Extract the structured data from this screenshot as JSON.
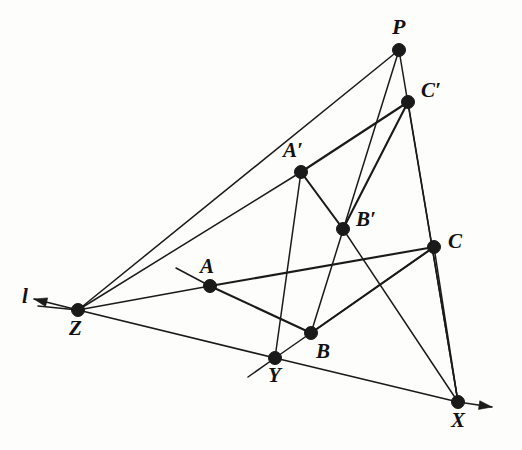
{
  "figure": {
    "background_color": "#fdfdfb",
    "stroke_color": "#1a1a1a",
    "label_color": "#111111",
    "width": 522,
    "height": 450,
    "point_radius": 6.5,
    "line_width": 2.1,
    "thin_line_width": 1.5
  },
  "points": [
    {
      "id": "P",
      "label": "P",
      "x": 399,
      "y": 50,
      "label_x": 392,
      "label_y": 16,
      "size": 22
    },
    {
      "id": "Cp",
      "label": "C′",
      "x": 408,
      "y": 102,
      "label_x": 421,
      "label_y": 80,
      "size": 21
    },
    {
      "id": "Ap",
      "label": "A′",
      "x": 301,
      "y": 172,
      "label_x": 283,
      "label_y": 140,
      "size": 21
    },
    {
      "id": "Bp",
      "label": "B′",
      "x": 343,
      "y": 229,
      "label_x": 356,
      "label_y": 209,
      "size": 21
    },
    {
      "id": "C",
      "label": "C",
      "x": 434,
      "y": 247,
      "label_x": 448,
      "label_y": 231,
      "size": 21
    },
    {
      "id": "A",
      "label": "A",
      "x": 210,
      "y": 286,
      "label_x": 200,
      "label_y": 256,
      "size": 21
    },
    {
      "id": "Z",
      "label": "Z",
      "x": 78,
      "y": 310,
      "label_x": 69,
      "label_y": 318,
      "size": 21
    },
    {
      "id": "B",
      "label": "B",
      "x": 311,
      "y": 333,
      "label_x": 316,
      "label_y": 341,
      "size": 21
    },
    {
      "id": "Y",
      "label": "Y",
      "x": 275,
      "y": 358,
      "label_x": 268,
      "label_y": 365,
      "size": 21
    },
    {
      "id": "X",
      "label": "X",
      "x": 458,
      "y": 402,
      "label_x": 451,
      "label_y": 410,
      "size": 21
    }
  ],
  "line_label": {
    "id": "l",
    "label": "l",
    "x": 22,
    "y": 286,
    "size": 21
  },
  "segments": [
    {
      "name": "P-A-Z",
      "from": "P",
      "to": "Z",
      "weight": "thin"
    },
    {
      "name": "P-Bp-B",
      "from": "P",
      "to": "B",
      "weight": "thin"
    },
    {
      "name": "P-Cp-X",
      "from": "P",
      "to": "X",
      "weight": "thin"
    },
    {
      "name": "Ap-Cp",
      "from": "Ap",
      "to": "Cp",
      "weight": "bold"
    },
    {
      "name": "Ap-Bp",
      "from": "Ap",
      "to": "Bp",
      "weight": "bold"
    },
    {
      "name": "Bp-Cp",
      "from": "Bp",
      "to": "Cp",
      "weight": "bold"
    },
    {
      "name": "A-C",
      "from": "A",
      "to": "C",
      "weight": "bold"
    },
    {
      "name": "A-B",
      "from": "A",
      "to": "B",
      "weight": "bold"
    },
    {
      "name": "B-C",
      "from": "B",
      "to": "C",
      "weight": "bold"
    },
    {
      "name": "Cp-X-extend",
      "from": "Cp",
      "to": "X",
      "weight": "thin"
    },
    {
      "name": "Bp-X",
      "from": "Bp",
      "to": "X",
      "weight": "thin"
    },
    {
      "name": "C-X",
      "from": "C",
      "to": "X",
      "weight": "thin"
    },
    {
      "name": "Y-C",
      "from": "Y",
      "to": "C",
      "weight": "thin"
    },
    {
      "name": "Ap-Y-extend",
      "from": "Ap",
      "to": "Y",
      "weight": "thin"
    },
    {
      "name": "Z-Ap",
      "from": "Z",
      "to": "Ap",
      "weight": "thin"
    },
    {
      "name": "Z-A",
      "from": "Z",
      "to": "A",
      "weight": "thin"
    }
  ],
  "axis_line": {
    "name": "line-l",
    "from_arrow": {
      "x": 34,
      "y": 299
    },
    "through": [
      "Z",
      "Y",
      "X"
    ],
    "to_arrow": {
      "x": 492,
      "y": 407
    }
  },
  "stubs": [
    {
      "name": "stub-past-A",
      "x1": 176,
      "y1": 268,
      "x2": 210,
      "y2": 286
    },
    {
      "name": "stub-past-Y",
      "x1": 275,
      "y1": 358,
      "x2": 248,
      "y2": 377
    },
    {
      "name": "stub-past-Z",
      "x1": 78,
      "y1": 310,
      "x2": 38,
      "y2": 306
    }
  ]
}
